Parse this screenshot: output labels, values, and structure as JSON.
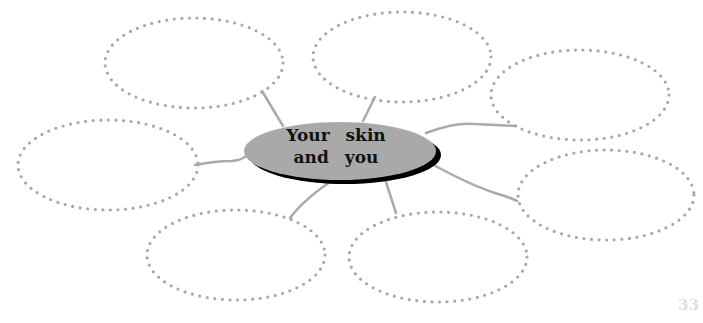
{
  "diagram": {
    "title": "Your skin and you",
    "center": {
      "line1": "Your skin",
      "line2": "and you",
      "fill": "#a9a9a9",
      "shadow": "#000000"
    },
    "bubble_count": 7,
    "bubble_style": {
      "border": "dotted",
      "color": "#a8a8a8"
    },
    "connector_color": "#aaaaaa"
  },
  "page": {
    "number": "33"
  }
}
